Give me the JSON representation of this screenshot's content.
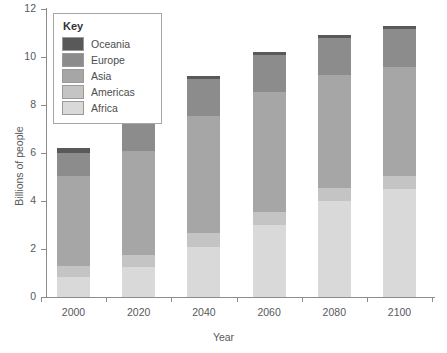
{
  "chart_data": {
    "type": "bar",
    "stacked": true,
    "title": "",
    "xlabel": "Year",
    "ylabel": "Billions of people",
    "categories": [
      "2000",
      "2020",
      "2040",
      "2060",
      "2080",
      "2100"
    ],
    "ylim": [
      0,
      12
    ],
    "yticks": [
      0,
      2,
      4,
      6,
      8,
      10,
      12
    ],
    "ytick_labels": [
      "0",
      "2",
      "4",
      "6",
      "8",
      "10",
      "12"
    ],
    "grid": false,
    "legend_title": "Key",
    "legend_position": "top-left-inside",
    "series": [
      {
        "name": "Africa",
        "color": "#d9d9d9",
        "values": [
          0.85,
          1.25,
          2.1,
          3.0,
          4.0,
          4.5
        ]
      },
      {
        "name": "Americas",
        "color": "#c4c4c4",
        "values": [
          0.45,
          0.5,
          0.55,
          0.55,
          0.55,
          0.55
        ]
      },
      {
        "name": "Asia",
        "color": "#a6a6a6",
        "values": [
          3.75,
          4.35,
          4.9,
          5.0,
          4.7,
          4.55
        ]
      },
      {
        "name": "Europe",
        "color": "#8c8c8c",
        "values": [
          0.95,
          1.55,
          1.55,
          1.55,
          1.55,
          1.55
        ]
      },
      {
        "name": "Oceania",
        "color": "#595959",
        "values": [
          0.2,
          0.15,
          0.1,
          0.1,
          0.1,
          0.15
        ]
      }
    ],
    "totals": [
      6.2,
      7.8,
      9.2,
      10.2,
      10.9,
      11.3
    ],
    "legend_entries": [
      {
        "label": "Oceania",
        "color": "#595959"
      },
      {
        "label": "Europe",
        "color": "#8c8c8c"
      },
      {
        "label": "Asia",
        "color": "#a6a6a6"
      },
      {
        "label": "Americas",
        "color": "#c4c4c4"
      },
      {
        "label": "Africa",
        "color": "#d9d9d9"
      }
    ]
  }
}
